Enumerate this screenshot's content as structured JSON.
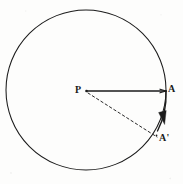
{
  "figure": {
    "type": "geometry-diagram",
    "background_color": "#fdfdfc",
    "ink_color": "#1b1b1b",
    "labels": {
      "centre": "P",
      "point_a": "A",
      "point_a_prime": "A'"
    },
    "geometry": {
      "circle": {
        "cx": 86,
        "cy": 90,
        "r": 80,
        "stroke_width": 1.1
      },
      "radius_solid": {
        "from": "P",
        "to": "A",
        "x1": 86,
        "y1": 91,
        "x2": 166,
        "y2": 91,
        "style": "solid"
      },
      "radius_dashed": {
        "from": "P",
        "to": "A'",
        "x1": 88,
        "y1": 93,
        "x2": 158,
        "y2": 137,
        "style": "dashed"
      },
      "arc_arrow": {
        "from": "A",
        "to": "A'",
        "direction": "clockwise",
        "arrowhead_at": {
          "x": 163,
          "y": 120
        }
      }
    }
  }
}
